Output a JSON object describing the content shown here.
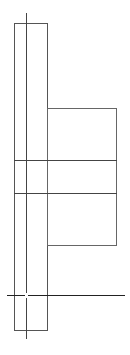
{
  "diagram": {
    "width": 130,
    "height": 355,
    "background": "#ffffff",
    "stroke_color": "#555555",
    "stroke_color_dark": "#333333",
    "tall_rect": {
      "x": 14,
      "y": 23,
      "w": 33,
      "h": 307
    },
    "center_vertical_line": {
      "x": 26,
      "y1": 13,
      "y2": 339
    },
    "side_box": {
      "x": 47,
      "y": 108,
      "w": 69,
      "h": 137
    },
    "divider_lines": [
      {
        "y": 160,
        "x1": 14,
        "x2": 116
      },
      {
        "y": 193,
        "x1": 14,
        "x2": 116
      }
    ],
    "base_line": {
      "y": 295,
      "x1": 7,
      "x2": 125
    },
    "intersection_gap": {
      "x": 26,
      "y": 295
    }
  }
}
